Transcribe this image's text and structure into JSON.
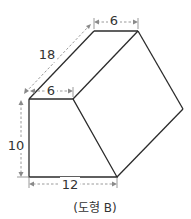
{
  "figure": {
    "caption": "(도형 B)",
    "shape": "prism",
    "dimensions": {
      "front_top_width": "6",
      "back_top_width": "6",
      "depth": "18",
      "height": "10",
      "bottom_width": "12"
    },
    "colors": {
      "edge": "#2b2b2b",
      "dimension_line": "#9a9a9a",
      "text": "#333333"
    }
  }
}
